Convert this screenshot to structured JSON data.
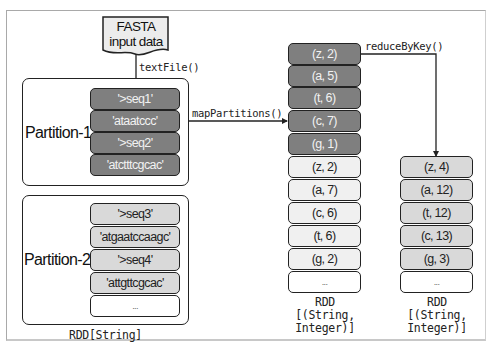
{
  "input_document": {
    "line1": "FASTA",
    "line2": "input data"
  },
  "operations": {
    "text_file": "textFile()",
    "map_partitions": "mapPartitions()",
    "reduce_by_key": "reduceByKey()"
  },
  "partitions": [
    {
      "label": "Partition-1",
      "records": [
        "'>seq1'",
        "'ataatccc'",
        "'>seq2'",
        "'atctttcgcac'"
      ]
    },
    {
      "label": "Partition-2",
      "records": [
        "'>seq3'",
        "'atgaatccaagc'",
        "'>seq4'",
        "'attgttcgcac'",
        "..."
      ]
    }
  ],
  "mapped_rdd": {
    "partition1_pairs": [
      "(z, 2)",
      "(a, 5)",
      "(t, 6)",
      "(c, 7)",
      "(g, 1)"
    ],
    "partition2_pairs": [
      "(z, 2)",
      "(a, 7)",
      "(c, 6)",
      "(t, 6)",
      "(g, 2)",
      "..."
    ]
  },
  "reduced_rdd": {
    "pairs": [
      "(z, 4)",
      "(a, 12)",
      "(t, 12)",
      "(c, 13)",
      "(g, 3)",
      "..."
    ]
  },
  "captions": {
    "string_rdd": "RDD[String]",
    "mapped_rdd_line1": "RDD",
    "mapped_rdd_line2": "[(String,",
    "mapped_rdd_line3": "Integer)]",
    "reduced_rdd_line1": "RDD",
    "reduced_rdd_line2": "[(String,",
    "reduced_rdd_line3": "Integer)]"
  },
  "colors": {
    "partition1_fill": "#7f7f7f",
    "partition2_fill": "#d9d9d9",
    "mapped_p2_fill": "#f0f0f0",
    "reduced_fill": "#d9d9d9"
  }
}
